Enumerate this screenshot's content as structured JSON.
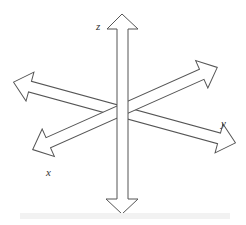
{
  "diagram": {
    "type": "3d-axes",
    "axes": [
      {
        "name": "z",
        "label": "z",
        "direction": "vertical"
      },
      {
        "name": "y",
        "label": "y",
        "direction": "upper-left to lower-right"
      },
      {
        "name": "x",
        "label": "x",
        "direction": "lower-left to upper-right"
      }
    ],
    "stroke_color": "#555555",
    "fill_color": "#ffffff"
  }
}
